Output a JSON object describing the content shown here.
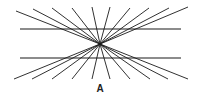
{
  "figure": {
    "label": "A",
    "center": [
      100,
      44
    ],
    "horizontal_lines": [
      {
        "x1": 20,
        "y1": 29,
        "x2": 181,
        "y2": 29
      },
      {
        "x1": 20,
        "y1": 58,
        "x2": 181,
        "y2": 58
      }
    ],
    "ray_top_ends": [
      [
        16,
        11
      ],
      [
        33,
        9
      ],
      [
        52,
        8
      ],
      [
        72,
        8
      ],
      [
        92,
        7
      ],
      [
        110,
        7
      ],
      [
        130,
        8
      ],
      [
        149,
        8
      ],
      [
        169,
        8
      ],
      [
        188,
        7
      ]
    ],
    "ray_bottom_ends": [
      [
        14,
        79
      ],
      [
        32,
        79
      ],
      [
        52,
        79
      ],
      [
        72,
        79
      ],
      [
        92,
        79
      ],
      [
        110,
        79
      ],
      [
        130,
        79
      ],
      [
        150,
        79
      ],
      [
        168,
        79
      ],
      [
        188,
        79
      ]
    ],
    "stroke_color": "#1a1a1a"
  }
}
